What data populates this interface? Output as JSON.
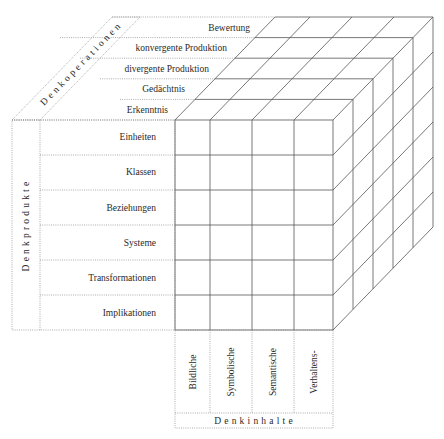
{
  "diagram": {
    "operations": {
      "caption": "Denkoperationen",
      "items": [
        "Bewertung",
        "konvergente Produktion",
        "divergente Produktion",
        "Gedächtnis",
        "Erkenntnis"
      ]
    },
    "products": {
      "caption": "Denkprodukte",
      "items": [
        "Einheiten",
        "Klassen",
        "Beziehungen",
        "Systeme",
        "Transformationen",
        "Implikationen"
      ]
    },
    "contents": {
      "caption": "Denkinhalte",
      "items": [
        "Bildliche",
        "Symbolische",
        "Semantische",
        "Verhaltens-"
      ]
    },
    "colors": {
      "line": "#555555",
      "dotted": "#888888",
      "text": "#2a2a2a"
    }
  }
}
